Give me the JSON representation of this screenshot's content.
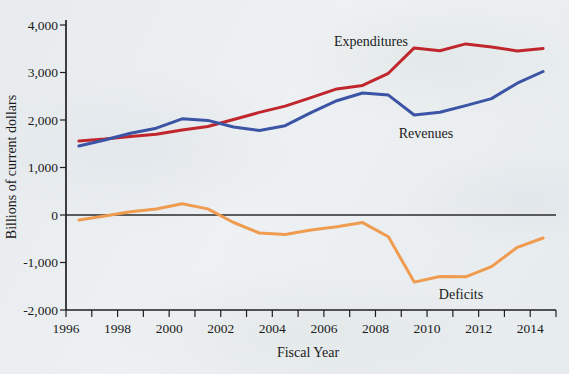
{
  "page": {
    "background": "#e9edf0"
  },
  "chart_data": {
    "type": "line",
    "title": "",
    "xlabel": "Fiscal Year",
    "ylabel": "Billions of current dollars",
    "xlim": [
      1996,
      2015
    ],
    "ylim": [
      -2000,
      4000
    ],
    "grid": false,
    "zero_line": true,
    "legend": "inline-labels",
    "point_x_offset": 0.5,
    "x_tick_years": [
      1996,
      1997,
      1998,
      1999,
      2000,
      2001,
      2002,
      2003,
      2004,
      2005,
      2006,
      2007,
      2008,
      2009,
      2010,
      2011,
      2012,
      2013,
      2014,
      2015
    ],
    "x_label_years": [
      1996,
      1998,
      2000,
      2002,
      2004,
      2006,
      2008,
      2010,
      2012,
      2014
    ],
    "x_tick_labels": [
      "1996",
      "1998",
      "2000",
      "2002",
      "2004",
      "2006",
      "2008",
      "2010",
      "2012",
      "2014"
    ],
    "y_ticks": [
      4000,
      3000,
      2000,
      1000,
      0,
      -1000,
      -2000
    ],
    "y_tick_labels": [
      "4,000",
      "3,000",
      "2,000",
      "1,000",
      "0",
      "-1,000",
      "-2,000"
    ],
    "years": [
      1996,
      1997,
      1998,
      1999,
      2000,
      2001,
      2002,
      2003,
      2004,
      2005,
      2006,
      2007,
      2008,
      2009,
      2010,
      2011,
      2012,
      2013,
      2014
    ],
    "series": [
      {
        "name": "Expenditures",
        "color": "#c0272d",
        "values": [
          1560,
          1601,
          1653,
          1702,
          1789,
          1863,
          2011,
          2160,
          2293,
          2472,
          2655,
          2729,
          2983,
          3518,
          3457,
          3603,
          3537,
          3455,
          3506
        ]
      },
      {
        "name": "Revenues",
        "color": "#3b54a5",
        "values": [
          1453,
          1579,
          1722,
          1827,
          2025,
          1991,
          1853,
          1782,
          1880,
          2154,
          2407,
          2568,
          2524,
          2105,
          2163,
          2304,
          2450,
          2775,
          3021
        ]
      },
      {
        "name": "Deficits",
        "color": "#ef9b50",
        "values": [
          -107,
          -22,
          69,
          126,
          236,
          128,
          -158,
          -378,
          -413,
          -318,
          -248,
          -161,
          -459,
          -1413,
          -1294,
          -1300,
          -1087,
          -680,
          -485
        ]
      }
    ],
    "axis_color": "#1f1f1f",
    "text_color": "#1b1b1b"
  }
}
